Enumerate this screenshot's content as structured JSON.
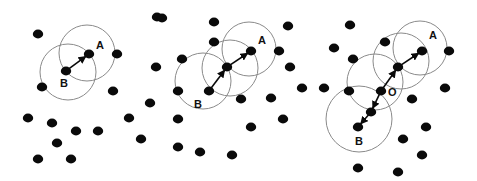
{
  "figure": {
    "colors": {
      "point": "#0a0a0a",
      "circle": "#8a8a8a",
      "arrow": "#0a0a0a",
      "background": "#ffffff"
    },
    "panels": [
      {
        "id": "direct-density-reachable",
        "labels": [
          {
            "text": "A",
            "at": "a"
          },
          {
            "text": "B",
            "at": "b"
          }
        ],
        "points": [
          [
            38,
            34
          ],
          [
            89,
            54
          ],
          [
            117,
            54
          ],
          [
            66,
            71
          ],
          [
            42,
            87
          ],
          [
            113,
            91
          ],
          [
            157,
            17
          ],
          [
            156,
            67
          ],
          [
            150,
            103
          ],
          [
            28,
            118
          ],
          [
            52,
            123
          ],
          [
            76,
            131
          ],
          [
            98,
            131
          ],
          [
            129,
            118
          ],
          [
            57,
            143
          ],
          [
            141,
            139
          ],
          [
            38,
            159
          ],
          [
            71,
            159
          ]
        ],
        "named_points": {
          "a": [
            89,
            54
          ],
          "b": [
            66,
            71
          ]
        },
        "circles": [
          [
            87,
            53,
            28
          ],
          [
            68,
            72,
            28
          ]
        ],
        "arrows": [
          [
            "b",
            "a"
          ]
        ]
      },
      {
        "id": "density-reachable",
        "labels": [
          {
            "text": "A",
            "at": "a"
          },
          {
            "text": "B",
            "at": "b"
          }
        ],
        "points": [
          [
            162,
            18
          ],
          [
            214,
            22
          ],
          [
            288,
            26
          ],
          [
            214,
            42
          ],
          [
            251,
            51
          ],
          [
            279,
            51
          ],
          [
            182,
            59
          ],
          [
            227,
            67
          ],
          [
            290,
            67
          ],
          [
            302,
            88
          ],
          [
            178,
            91
          ],
          [
            209,
            91
          ],
          [
            241,
            99
          ],
          [
            271,
            98
          ],
          [
            178,
            119
          ],
          [
            283,
            119
          ],
          [
            251,
            127
          ],
          [
            178,
            147
          ],
          [
            200,
            152
          ],
          [
            232,
            155
          ]
        ],
        "named_points": {
          "a": [
            251,
            51
          ],
          "m": [
            227,
            67
          ],
          "b": [
            209,
            91
          ]
        },
        "circles": [
          [
            249,
            49,
            27
          ],
          [
            230,
            68,
            28
          ],
          [
            203,
            81,
            28
          ]
        ],
        "arrows": [
          [
            "b",
            "m"
          ],
          [
            "m",
            "a"
          ]
        ]
      },
      {
        "id": "density-connected",
        "labels": [
          {
            "text": "A",
            "at": "a"
          },
          {
            "text": "O",
            "at": "o"
          },
          {
            "text": "B",
            "at": "b"
          }
        ],
        "points": [
          [
            350,
            25
          ],
          [
            334,
            48
          ],
          [
            385,
            42
          ],
          [
            422,
            51
          ],
          [
            449,
            51
          ],
          [
            353,
            59
          ],
          [
            398,
            67
          ],
          [
            324,
            88
          ],
          [
            349,
            91
          ],
          [
            381,
            91
          ],
          [
            445,
            88
          ],
          [
            412,
            99
          ],
          [
            371,
            112
          ],
          [
            358,
            127
          ],
          [
            426,
            127
          ],
          [
            403,
            139
          ],
          [
            422,
            155
          ],
          [
            358,
            168
          ],
          [
            398,
            172
          ]
        ],
        "named_points": {
          "a": [
            422,
            51
          ],
          "p": [
            398,
            67
          ],
          "o": [
            381,
            91
          ],
          "q": [
            371,
            112
          ],
          "b": [
            358,
            127
          ]
        },
        "circles": [
          [
            420,
            48,
            27
          ],
          [
            401,
            61,
            28
          ],
          [
            375,
            82,
            28
          ],
          [
            359,
            119,
            33
          ]
        ],
        "arrows": [
          [
            "o",
            "p"
          ],
          [
            "p",
            "a"
          ],
          [
            "o",
            "q"
          ],
          [
            "q",
            "b"
          ]
        ]
      }
    ]
  }
}
